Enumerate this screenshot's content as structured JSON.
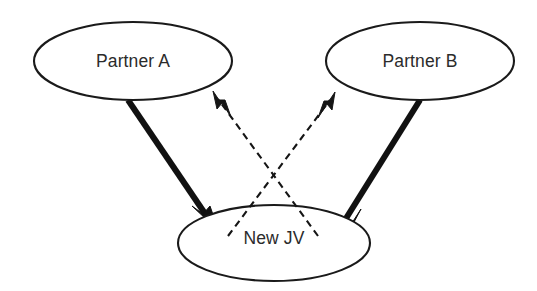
{
  "diagram": {
    "type": "joint-venture-structure-diagram",
    "background_color": "#ffffff",
    "stroke_color": "#111111",
    "text_color": "#2b2b2b",
    "nodes": [
      {
        "id": "partner-a",
        "label": "Partner A",
        "shape": "ellipse",
        "cx": 133,
        "cy": 61,
        "rx": 99,
        "ry": 39
      },
      {
        "id": "partner-b",
        "label": "Partner B",
        "shape": "ellipse",
        "cx": 420,
        "cy": 61,
        "rx": 94,
        "ry": 39
      },
      {
        "id": "new-jv",
        "label": "New JV",
        "shape": "ellipse",
        "cx": 274,
        "cy": 243,
        "rx": 96,
        "ry": 38
      }
    ],
    "edges": [
      {
        "id": "partner-a-to-new-jv",
        "from": "partner-a",
        "to": "new-jv",
        "style": "solid",
        "weight": "thick",
        "arrowhead": "end",
        "x1": 128,
        "y1": 100,
        "x2": 220,
        "y2": 235
      },
      {
        "id": "partner-b-to-new-jv",
        "from": "partner-b",
        "to": "new-jv",
        "style": "solid",
        "weight": "thick",
        "arrowhead": "end",
        "x1": 420,
        "y1": 100,
        "x2": 333,
        "y2": 237
      },
      {
        "id": "new-jv-to-partner-b",
        "from": "new-jv",
        "to": "partner-b",
        "style": "dashed",
        "weight": "thin",
        "arrowhead": "end",
        "x1": 228,
        "y1": 236,
        "x2": 335,
        "y2": 92
      },
      {
        "id": "new-jv-to-partner-a",
        "from": "new-jv",
        "to": "partner-a",
        "style": "dashed",
        "weight": "thin",
        "arrowhead": "end",
        "x1": 318,
        "y1": 236,
        "x2": 213,
        "y2": 91
      }
    ],
    "crossing_point": {
      "x": 272,
      "y": 167
    }
  }
}
